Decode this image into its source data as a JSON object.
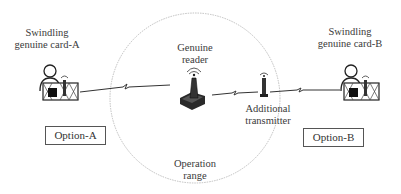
{
  "diagram": {
    "type": "relay-attack-illustration",
    "operation_range": {
      "label_line1": "Operation",
      "label_line2": "range",
      "circle_style": "dashed-gray"
    },
    "genuine_reader": {
      "label_line1": "Genuine",
      "label_line2": "reader",
      "icon": "rfid-reader-icon"
    },
    "additional_transmitter": {
      "label_line1": "Additional",
      "label_line2": "transmitter",
      "icon": "antenna-transmitter-icon"
    },
    "card_a": {
      "label_line1": "Swindling",
      "label_line2": "genuine card-A",
      "icon": "person-with-card-icon"
    },
    "card_b": {
      "label_line1": "Swindling",
      "label_line2": "genuine card-B",
      "icon": "person-with-card-icon"
    },
    "option_a": {
      "label": "Option-A"
    },
    "option_b": {
      "label": "Option-B"
    },
    "links": [
      {
        "from": "card_a",
        "to": "genuine_reader",
        "style": "lightning-wireless"
      },
      {
        "from": "genuine_reader",
        "to": "additional_transmitter",
        "style": "lightning-wireless"
      },
      {
        "from": "additional_transmitter",
        "to": "card_b",
        "style": "lightning-wireless"
      }
    ],
    "colors": {
      "line": "#333333",
      "circle": "#aaaaaa",
      "box_border": "#555555",
      "text": "#3a3a3a"
    }
  }
}
